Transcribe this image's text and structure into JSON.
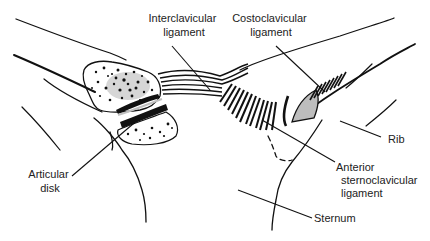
{
  "colors": {
    "line": "#111111",
    "text": "#222222",
    "background": "#ffffff",
    "cartilage_fill": "#bdbdbd",
    "marrow_fill": "#c8c8c8"
  },
  "labels": {
    "interclavicular": [
      "Interclavicular",
      "ligament"
    ],
    "costoclavicular": [
      "Costoclavicular",
      "ligament"
    ],
    "rib": [
      "Rib"
    ],
    "anterior_sternoclavicular": [
      "Anterior",
      "sternoclavicular",
      "ligament"
    ],
    "sternum": [
      "Sternum"
    ],
    "articular_disk": [
      "Articular",
      "disk"
    ]
  },
  "structures": [
    "clavicle",
    "sternum",
    "first rib",
    "articular disk",
    "interclavicular ligament",
    "costoclavicular ligament",
    "anterior sternoclavicular ligament"
  ]
}
